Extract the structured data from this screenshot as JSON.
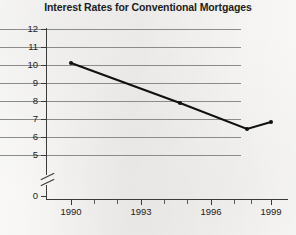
{
  "chart_data": {
    "type": "line",
    "title": "Interest Rates for Conventional Mortgages",
    "xlabel": "",
    "ylabel": "Percent",
    "x": [
      1990,
      1994,
      1998,
      1999
    ],
    "values": [
      10.1,
      8.0,
      7.0,
      7.3
    ],
    "series": [
      {
        "name": "Interest rate",
        "x": [
          1990,
          1994,
          1998,
          1999
        ],
        "values": [
          10.1,
          8.0,
          7.0,
          7.3
        ]
      }
    ],
    "xlim": [
      1989,
      2000
    ],
    "ylim": [
      5,
      12
    ],
    "y_axis_break": true,
    "y_axis_break_label": "0",
    "ytick_labels": [
      "12",
      "11",
      "10",
      "9",
      "8",
      "7",
      "6",
      "5",
      "0"
    ],
    "ytick_values": [
      12,
      11,
      10,
      9,
      8,
      7,
      6,
      5,
      0
    ],
    "xtick_labels": [
      "1990",
      "1993",
      "1996",
      "1999"
    ],
    "xtick_values": [
      1990,
      1993,
      1996,
      1999
    ],
    "xtick_minor_values": [
      1991,
      1992,
      1994,
      1995,
      1997,
      1998
    ],
    "grid": "horizontal",
    "legend": "none",
    "marker": "filled-circle",
    "line_color": "#101010",
    "grid_color": "#8b8b8b",
    "axis_color": "#3a3a3a",
    "background_color": "#f4f3f1",
    "annotations": []
  },
  "axes": {
    "y_label": "Percent",
    "y_ticks": [
      {
        "label": "12",
        "value": 12,
        "y": 29
      },
      {
        "label": "11",
        "value": 11,
        "y": 47
      },
      {
        "label": "10",
        "value": 10,
        "y": 65
      },
      {
        "label": "9",
        "value": 9,
        "y": 83
      },
      {
        "label": "8",
        "value": 8,
        "y": 101
      },
      {
        "label": "7",
        "value": 7,
        "y": 119
      },
      {
        "label": "6",
        "value": 6,
        "y": 137
      },
      {
        "label": "5",
        "value": 5,
        "y": 155
      },
      {
        "label": "0",
        "value": 0,
        "y": 196
      }
    ],
    "x_ticks_major": [
      {
        "label": "1990",
        "value": 1990,
        "x": 71
      },
      {
        "label": "1993",
        "value": 1993,
        "x": 141
      },
      {
        "label": "1996",
        "value": 1996,
        "x": 211
      },
      {
        "label": "1999",
        "value": 1999,
        "x": 271
      }
    ],
    "x_ticks_minor_x": [
      94,
      117,
      164,
      187,
      234,
      251
    ]
  },
  "points": [
    {
      "label": "1990",
      "value": "10.1",
      "cx": 71,
      "cy": 63
    },
    {
      "label": "1994",
      "value": "8.0",
      "cx": 180,
      "cy": 103
    },
    {
      "label": "1998",
      "value": "7.0",
      "cx": 247,
      "cy": 129
    },
    {
      "label": "1999",
      "value": "7.3",
      "cx": 271,
      "cy": 122
    }
  ],
  "polyline": "71,63 180,103 247,129 271,122"
}
